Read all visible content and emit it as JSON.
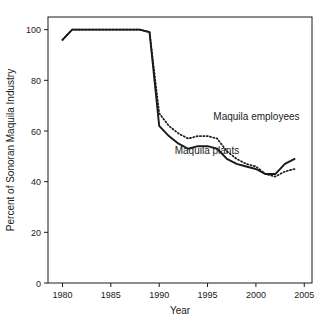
{
  "chart_data": {
    "type": "line",
    "title": "",
    "subtitle": "",
    "xlabel": "Year",
    "ylabel": "Percent of Sonoran Maquila Industry",
    "xlim": [
      1978.5,
      2005.8
    ],
    "ylim": [
      0,
      105
    ],
    "grid": false,
    "legend_position": "inline-annotation",
    "xticks": [
      1980,
      1985,
      1990,
      1995,
      2000,
      2005
    ],
    "xtick_labels": [
      "1980",
      "1985",
      "1990",
      "1995",
      "2000",
      "2005"
    ],
    "yticks": [
      0,
      20,
      40,
      60,
      80,
      100
    ],
    "ytick_labels": [
      "0",
      "20",
      "40",
      "60",
      "80",
      "100"
    ],
    "series": [
      {
        "name": "Maquila plants",
        "style": "solid",
        "color": "#1a1a1a",
        "x": [
          1980,
          1981,
          1982,
          1983,
          1984,
          1985,
          1986,
          1987,
          1988,
          1989,
          1990,
          1991,
          1992,
          1993,
          1994,
          1995,
          1996,
          1997,
          1998,
          1999,
          2000,
          2001,
          2002,
          2003,
          2004
        ],
        "values": [
          96,
          100,
          100,
          100,
          100,
          100,
          100,
          100,
          100,
          99,
          62,
          58,
          55,
          53,
          54,
          54,
          53,
          49,
          47,
          46,
          45,
          43,
          43,
          47,
          49
        ]
      },
      {
        "name": "Maquila employees",
        "style": "dotted",
        "color": "#1a1a1a",
        "x": [
          1980,
          1981,
          1982,
          1983,
          1984,
          1985,
          1986,
          1987,
          1988,
          1989,
          1990,
          1991,
          1992,
          1993,
          1994,
          1995,
          1996,
          1997,
          1998,
          1999,
          2000,
          2001,
          2002,
          2003,
          2004
        ],
        "values": [
          96,
          100,
          100,
          100,
          100,
          100,
          100,
          100,
          100,
          99,
          67,
          62,
          59,
          57,
          58,
          58,
          57,
          52,
          49,
          47,
          46,
          43,
          42,
          44,
          45
        ]
      }
    ],
    "annotations": [
      {
        "text": "Maquila employees",
        "x": 1995.6,
        "y": 64.5,
        "series": "Maquila employees"
      },
      {
        "text": "Maquila plants",
        "x": 1991.6,
        "y": 51.0,
        "series": "Maquila plants"
      }
    ]
  }
}
